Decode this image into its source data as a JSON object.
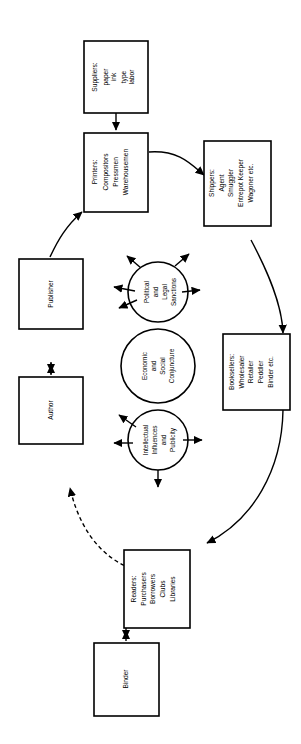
{
  "diagram": {
    "orientation": "rotated-90",
    "nodes": {
      "suppliers": {
        "heading": "Suppliers:",
        "lines": [
          "paper",
          "ink",
          "type",
          "labor"
        ]
      },
      "printers": {
        "heading": "Printers:",
        "lines": [
          "Compositors",
          "Pressmen",
          "Warehousemen"
        ]
      },
      "shippers": {
        "heading": "Shippers:",
        "lines": [
          "Agent",
          "Smuggler",
          "Entrepot Keeper",
          "Wagoner etc."
        ]
      },
      "booksellers": {
        "heading": "Booksellers:",
        "lines": [
          "Wholesaler",
          "Retailer",
          "Peddler",
          "Binder etc."
        ]
      },
      "readers": {
        "heading": "Readers:",
        "lines": [
          "Purchasers",
          "Borrowers",
          "Clubs",
          "Libraries"
        ]
      },
      "publisher": {
        "heading": "Publisher",
        "lines": []
      },
      "author": {
        "heading": "Author",
        "lines": []
      },
      "binder": {
        "heading": "Binder",
        "lines": []
      }
    },
    "circles": {
      "political": {
        "lines": [
          "Political",
          "and",
          "Legal",
          "Sanctions"
        ]
      },
      "economic": {
        "lines": [
          "Economic",
          "and",
          "Social",
          "Conjuncture"
        ]
      },
      "intellectual": {
        "lines": [
          "Intellectual",
          "Influences",
          "and",
          "Publicity"
        ]
      }
    },
    "colors": {
      "stroke": "#000000",
      "fill": "#ffffff",
      "background": "#ffffff"
    }
  }
}
